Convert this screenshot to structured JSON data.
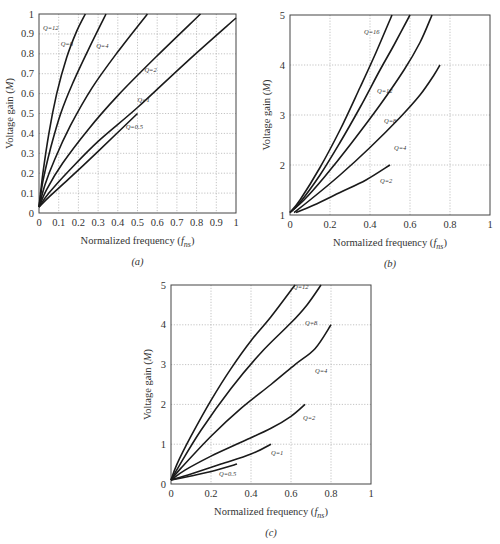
{
  "chart_data": [
    {
      "id": "a",
      "type": "line",
      "caption": "(a)",
      "xlabel": "Normalized frequency (f_ns)",
      "ylabel": "Voltage gain (M)",
      "xlim": [
        0,
        1
      ],
      "ylim": [
        0,
        1
      ],
      "xticks": [
        "0",
        "0.1",
        "0.2",
        "0.3",
        "0.4",
        "0.5",
        "0.6",
        "0.7",
        "0.8",
        "0.9",
        "1"
      ],
      "yticks": [
        "0",
        "0.1",
        "0.2",
        "0.3",
        "0.4",
        "0.5",
        "0.6",
        "0.7",
        "0.8",
        "0.9",
        "1"
      ],
      "grid": true,
      "box": {
        "x0": 39,
        "y0": 14,
        "x1": 236,
        "y1": 213
      },
      "series": [
        {
          "name": "Q=12",
          "label_at": [
            0.02,
            0.92
          ],
          "points": [
            [
              0,
              0.03
            ],
            [
              0.02,
              0.2
            ],
            [
              0.05,
              0.4
            ],
            [
              0.09,
              0.6
            ],
            [
              0.14,
              0.78
            ],
            [
              0.19,
              0.91
            ],
            [
              0.235,
              1.0
            ]
          ]
        },
        {
          "name": "Q=8",
          "label_at": [
            0.11,
            0.84
          ],
          "points": [
            [
              0,
              0.03
            ],
            [
              0.02,
              0.16
            ],
            [
              0.06,
              0.33
            ],
            [
              0.11,
              0.5
            ],
            [
              0.17,
              0.65
            ],
            [
              0.25,
              0.82
            ],
            [
              0.34,
              1.0
            ]
          ]
        },
        {
          "name": "Q=4",
          "label_at": [
            0.29,
            0.83
          ],
          "points": [
            [
              0,
              0.03
            ],
            [
              0.03,
              0.14
            ],
            [
              0.08,
              0.27
            ],
            [
              0.16,
              0.44
            ],
            [
              0.27,
              0.63
            ],
            [
              0.4,
              0.81
            ],
            [
              0.55,
              1.0
            ]
          ]
        },
        {
          "name": "Q=2",
          "label_at": [
            0.535,
            0.71
          ],
          "points": [
            [
              0,
              0.03
            ],
            [
              0.04,
              0.12
            ],
            [
              0.12,
              0.25
            ],
            [
              0.25,
              0.42
            ],
            [
              0.4,
              0.59
            ],
            [
              0.6,
              0.79
            ],
            [
              0.82,
              1.0
            ]
          ]
        },
        {
          "name": "Q=1",
          "label_at": [
            0.5,
            0.56
          ],
          "points": [
            [
              0,
              0.03
            ],
            [
              0.05,
              0.1
            ],
            [
              0.15,
              0.21
            ],
            [
              0.3,
              0.36
            ],
            [
              0.5,
              0.53
            ],
            [
              0.75,
              0.76
            ],
            [
              1.0,
              0.98
            ]
          ]
        },
        {
          "name": "Q=0.5",
          "label_at": [
            0.44,
            0.42
          ],
          "points": [
            [
              0,
              0.03
            ],
            [
              0.05,
              0.08
            ],
            [
              0.15,
              0.17
            ],
            [
              0.3,
              0.31
            ],
            [
              0.5,
              0.5
            ]
          ]
        }
      ]
    },
    {
      "id": "b",
      "type": "line",
      "caption": "(b)",
      "xlabel": "Normalized frequency (f_ns)",
      "ylabel": "Voltage gain (M)",
      "xlim": [
        0,
        1
      ],
      "ylim": [
        1,
        5
      ],
      "xticks": [
        "0",
        "0.2",
        "0.4",
        "0.6",
        "0.8",
        "1"
      ],
      "yticks": [
        "1",
        "2",
        "3",
        "4",
        "5"
      ],
      "grid": true,
      "box": {
        "x0": 290,
        "y0": 15,
        "x1": 490,
        "y1": 215
      },
      "series": [
        {
          "name": "Q=16",
          "label_at": [
            0.37,
            4.62
          ],
          "points": [
            [
              0.0,
              1.05
            ],
            [
              0.05,
              1.3
            ],
            [
              0.15,
              1.95
            ],
            [
              0.25,
              2.7
            ],
            [
              0.35,
              3.55
            ],
            [
              0.43,
              4.25
            ],
            [
              0.51,
              5.0
            ]
          ]
        },
        {
          "name": "Q=12",
          "label_at": [
            0.435,
            3.45
          ],
          "points": [
            [
              0.0,
              1.05
            ],
            [
              0.05,
              1.25
            ],
            [
              0.15,
              1.8
            ],
            [
              0.25,
              2.45
            ],
            [
              0.35,
              3.15
            ],
            [
              0.45,
              3.9
            ],
            [
              0.52,
              4.4
            ],
            [
              0.6,
              5.0
            ]
          ]
        },
        {
          "name": "Q=8",
          "label_at": [
            0.47,
            2.85
          ],
          "points": [
            [
              0.0,
              1.05
            ],
            [
              0.07,
              1.3
            ],
            [
              0.17,
              1.75
            ],
            [
              0.3,
              2.4
            ],
            [
              0.45,
              3.2
            ],
            [
              0.57,
              3.9
            ],
            [
              0.65,
              4.45
            ],
            [
              0.71,
              5.0
            ]
          ]
        },
        {
          "name": "Q=4",
          "label_at": [
            0.52,
            2.3
          ],
          "points": [
            [
              0.02,
              1.05
            ],
            [
              0.1,
              1.3
            ],
            [
              0.25,
              1.8
            ],
            [
              0.4,
              2.35
            ],
            [
              0.55,
              2.95
            ],
            [
              0.65,
              3.4
            ],
            [
              0.72,
              3.8
            ],
            [
              0.75,
              4.0
            ]
          ]
        },
        {
          "name": "Q=2",
          "label_at": [
            0.45,
            1.65
          ],
          "points": [
            [
              0.03,
              1.05
            ],
            [
              0.12,
              1.2
            ],
            [
              0.25,
              1.45
            ],
            [
              0.38,
              1.7
            ],
            [
              0.5,
              2.0
            ]
          ]
        }
      ]
    },
    {
      "id": "c",
      "type": "line",
      "caption": "(c)",
      "xlabel": "Normalized frequency (f_ns)",
      "ylabel": "Voltage gain (M)",
      "xlim": [
        0,
        1
      ],
      "ylim": [
        0,
        5
      ],
      "xticks": [
        "0",
        "0.2",
        "0.4",
        "0.6",
        "0.8",
        "1"
      ],
      "yticks": [
        "0",
        "1",
        "2",
        "3",
        "4",
        "5"
      ],
      "grid": true,
      "box": {
        "x0": 171,
        "y0": 285,
        "x1": 371,
        "y1": 484
      },
      "series": [
        {
          "name": "Q=12",
          "label_at": [
            0.61,
            4.9
          ],
          "points": [
            [
              0,
              0.1
            ],
            [
              0.03,
              0.5
            ],
            [
              0.1,
              1.2
            ],
            [
              0.2,
              2.1
            ],
            [
              0.3,
              2.9
            ],
            [
              0.4,
              3.6
            ],
            [
              0.5,
              4.2
            ],
            [
              0.62,
              5.0
            ]
          ]
        },
        {
          "name": "Q=8",
          "label_at": [
            0.67,
            4.0
          ],
          "points": [
            [
              0,
              0.1
            ],
            [
              0.04,
              0.45
            ],
            [
              0.15,
              1.35
            ],
            [
              0.3,
              2.4
            ],
            [
              0.45,
              3.3
            ],
            [
              0.6,
              4.05
            ],
            [
              0.68,
              4.5
            ],
            [
              0.75,
              5.0
            ]
          ]
        },
        {
          "name": "Q=4",
          "label_at": [
            0.72,
            2.8
          ],
          "points": [
            [
              0,
              0.1
            ],
            [
              0.05,
              0.4
            ],
            [
              0.2,
              1.2
            ],
            [
              0.35,
              1.9
            ],
            [
              0.5,
              2.5
            ],
            [
              0.62,
              3.0
            ],
            [
              0.72,
              3.4
            ],
            [
              0.8,
              4.0
            ]
          ]
        },
        {
          "name": "Q=2",
          "label_at": [
            0.66,
            1.62
          ],
          "points": [
            [
              0,
              0.1
            ],
            [
              0.07,
              0.35
            ],
            [
              0.2,
              0.7
            ],
            [
              0.35,
              1.05
            ],
            [
              0.5,
              1.4
            ],
            [
              0.6,
              1.7
            ],
            [
              0.67,
              2.0
            ]
          ]
        },
        {
          "name": "Q=1",
          "label_at": [
            0.5,
            0.72
          ],
          "points": [
            [
              0,
              0.1
            ],
            [
              0.1,
              0.25
            ],
            [
              0.25,
              0.5
            ],
            [
              0.4,
              0.75
            ],
            [
              0.5,
              1.0
            ]
          ]
        },
        {
          "name": "Q=0.5",
          "label_at": [
            0.24,
            0.2
          ],
          "points": [
            [
              0,
              0.1
            ],
            [
              0.1,
              0.2
            ],
            [
              0.22,
              0.34
            ],
            [
              0.33,
              0.5
            ]
          ]
        }
      ]
    }
  ]
}
